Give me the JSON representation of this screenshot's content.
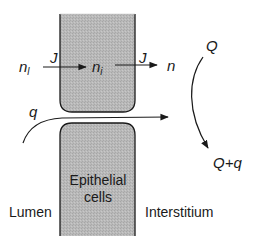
{
  "diagram": {
    "regions": {
      "lumen": "Lumen",
      "cells": "Epithelial cells",
      "cells_line1": "Epithelial",
      "cells_line2": "cells",
      "interstitium": "Interstitium"
    },
    "variables": {
      "n_lumen": {
        "base": "n",
        "sub": "l"
      },
      "n_cell": {
        "base": "n",
        "sub": "i"
      },
      "n_interstitium": "n",
      "flux_in": "J",
      "flux_out": "J",
      "paracellular_flow": "q",
      "interstitial_flow_in": "Q",
      "interstitial_flow_out": "Q+q"
    },
    "colors": {
      "cell_fill": "#b8b8b8",
      "stroke": "#1a1a1a",
      "background": "#ffffff"
    }
  }
}
